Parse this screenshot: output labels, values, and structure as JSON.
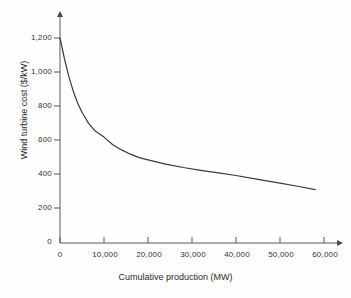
{
  "chart_data": {
    "type": "line",
    "title": "",
    "xlabel": "Cumulative production (MW)",
    "ylabel": "Wind turbine cost ($/kW)",
    "xlim": [
      0,
      60000
    ],
    "ylim": [
      0,
      1200
    ],
    "grid": false,
    "legend": "none",
    "xticks": [
      "0",
      "10,000",
      "20,000",
      "30,000",
      "40,000",
      "50,000",
      "60,000"
    ],
    "xtick_values": [
      0,
      10000,
      20000,
      30000,
      40000,
      50000,
      60000
    ],
    "yticks": [
      "0",
      "200",
      "400",
      "600",
      "800",
      "1,000",
      "1,200"
    ],
    "ytick_values": [
      0,
      200,
      400,
      600,
      800,
      1000,
      1200
    ],
    "series": [
      {
        "name": "Wind turbine cost experience curve",
        "x": [
          0,
          1000,
          2000,
          3000,
          4000,
          5000,
          6500,
          8000,
          10000,
          12000,
          14000,
          16000,
          18000,
          20000,
          24000,
          28000,
          32000,
          36000,
          40000,
          45000,
          50000,
          54000,
          58000
        ],
        "values": [
          1200,
          1080,
          975,
          890,
          820,
          765,
          700,
          655,
          620,
          575,
          545,
          520,
          500,
          487,
          462,
          442,
          425,
          410,
          395,
          372,
          350,
          332,
          312
        ]
      }
    ],
    "axis_style": "arrow-tipped",
    "line_color": "#3a3a3a",
    "axis_color": "#555555"
  }
}
